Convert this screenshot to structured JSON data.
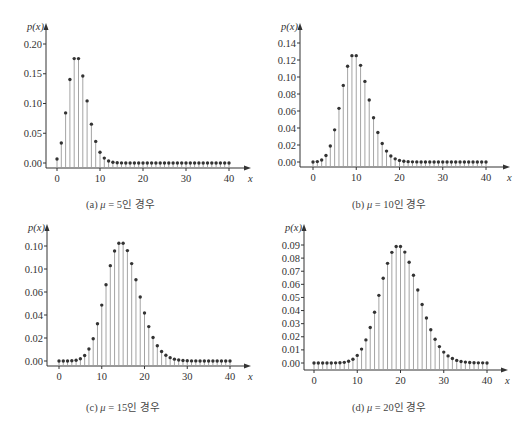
{
  "figure": {
    "caption_cropped": "",
    "colors": {
      "stem": "#9a9a9a",
      "dot": "#333333",
      "axis": "#333333",
      "text": "#333333"
    }
  },
  "chart_data": [
    {
      "id": "a",
      "type": "stem",
      "title": "",
      "caption": {
        "prefix": "(a) ",
        "mu_symbol": "μ",
        "rest": " = 5인 경우"
      },
      "xlabel": "x",
      "ylabel": "p(x)",
      "x_ticks": [
        "0",
        "10",
        "20",
        "30",
        "40"
      ],
      "y_ticks": [
        "0.00",
        "0.05",
        "0.10",
        "0.15",
        "0.20"
      ],
      "y_tick_values": [
        0.0,
        0.05,
        0.1,
        0.15,
        0.2
      ],
      "xlim": [
        0,
        40
      ],
      "ylim": [
        0,
        0.2
      ],
      "grid": false,
      "layout": {
        "x0": 57,
        "x40": 229,
        "y0px": 163,
        "ytop_px": 44,
        "ytop_val": 0.2,
        "yaxis_x": 46,
        "xaxis_y": 168,
        "arrow_right": 251,
        "arrow_top": 23,
        "tick_label_y": 182,
        "cap_x": 86,
        "cap_y": 196
      },
      "x": [
        0,
        1,
        2,
        3,
        4,
        5,
        6,
        7,
        8,
        9,
        10,
        11,
        12,
        13,
        14,
        15,
        16,
        17,
        18,
        19,
        20,
        21,
        22,
        23,
        24,
        25,
        26,
        27,
        28,
        29,
        30,
        31,
        32,
        33,
        34,
        35,
        36,
        37,
        38,
        39,
        40
      ],
      "values": [
        0.0067,
        0.0337,
        0.0842,
        0.1404,
        0.1755,
        0.1755,
        0.1462,
        0.1044,
        0.0653,
        0.0363,
        0.0181,
        0.0082,
        0.0034,
        0.0013,
        0.0005,
        0.0002,
        0.0,
        0.0,
        0.0,
        0.0,
        0.0,
        0.0,
        0.0,
        0.0,
        0.0,
        0.0,
        0.0,
        0.0,
        0.0,
        0.0,
        0.0,
        0.0,
        0.0,
        0.0,
        0.0,
        0.0,
        0.0,
        0.0,
        0.0,
        0.0,
        0.0
      ]
    },
    {
      "id": "b",
      "type": "stem",
      "title": "",
      "caption": {
        "prefix": "(b) ",
        "mu_symbol": "μ",
        "rest": " = 10인 경우"
      },
      "xlabel": "x",
      "ylabel": "p(x)",
      "x_ticks": [
        "0",
        "10",
        "20",
        "30",
        "40"
      ],
      "y_ticks": [
        "0.00",
        "0.02",
        "0.04",
        "0.06",
        "0.08",
        "0.10",
        "0.12",
        "0.14"
      ],
      "y_tick_values": [
        0.0,
        0.02,
        0.04,
        0.06,
        0.08,
        0.1,
        0.12,
        0.14
      ],
      "xlim": [
        0,
        40
      ],
      "ylim": [
        0,
        0.14
      ],
      "grid": false,
      "layout": {
        "x0": 313,
        "x40": 486,
        "y0px": 162,
        "ytop_px": 43,
        "ytop_val": 0.14,
        "yaxis_x": 300,
        "xaxis_y": 167,
        "arrow_right": 510,
        "arrow_top": 23,
        "tick_label_y": 181,
        "cap_x": 352,
        "cap_y": 196
      },
      "x": [
        0,
        1,
        2,
        3,
        4,
        5,
        6,
        7,
        8,
        9,
        10,
        11,
        12,
        13,
        14,
        15,
        16,
        17,
        18,
        19,
        20,
        21,
        22,
        23,
        24,
        25,
        26,
        27,
        28,
        29,
        30,
        31,
        32,
        33,
        34,
        35,
        36,
        37,
        38,
        39,
        40
      ],
      "values": [
        0.0,
        0.0005,
        0.0023,
        0.0076,
        0.0189,
        0.0378,
        0.0631,
        0.0901,
        0.1126,
        0.1251,
        0.1251,
        0.1137,
        0.0948,
        0.0729,
        0.0521,
        0.0347,
        0.0217,
        0.0128,
        0.0071,
        0.0037,
        0.0019,
        0.0009,
        0.0004,
        0.0002,
        0.0001,
        0.0,
        0.0,
        0.0,
        0.0,
        0.0,
        0.0,
        0.0,
        0.0,
        0.0,
        0.0,
        0.0,
        0.0,
        0.0,
        0.0,
        0.0,
        0.0
      ]
    },
    {
      "id": "c",
      "type": "stem",
      "title": "",
      "caption": {
        "prefix": "(c) ",
        "mu_symbol": "μ",
        "rest": " = 15인 경우"
      },
      "xlabel": "x",
      "ylabel": "p(x)",
      "x_ticks": [
        "0",
        "10",
        "20",
        "30",
        "40"
      ],
      "y_ticks": [
        "0.00",
        "0.02",
        "0.04",
        "0.06",
        "0.10",
        "0.10"
      ],
      "y_tick_values": [
        0.0,
        0.02,
        0.04,
        0.06,
        0.08,
        0.1
      ],
      "xlim": [
        0,
        40
      ],
      "ylim": [
        0,
        0.1
      ],
      "grid": false,
      "layout": {
        "x0": 59,
        "x40": 230,
        "y0px": 361,
        "ytop_px": 246,
        "ytop_val": 0.1,
        "yaxis_x": 47,
        "xaxis_y": 366,
        "arrow_right": 251,
        "arrow_top": 224,
        "tick_label_y": 380,
        "cap_x": 86,
        "cap_y": 399
      },
      "x": [
        0,
        1,
        2,
        3,
        4,
        5,
        6,
        7,
        8,
        9,
        10,
        11,
        12,
        13,
        14,
        15,
        16,
        17,
        18,
        19,
        20,
        21,
        22,
        23,
        24,
        25,
        26,
        27,
        28,
        29,
        30,
        31,
        32,
        33,
        34,
        35,
        36,
        37,
        38,
        39,
        40
      ],
      "values": [
        0.0,
        0.0,
        0.0,
        0.0002,
        0.0006,
        0.0019,
        0.0048,
        0.0104,
        0.0194,
        0.0324,
        0.0486,
        0.0663,
        0.0829,
        0.0956,
        0.1024,
        0.1024,
        0.096,
        0.0847,
        0.0706,
        0.0557,
        0.0418,
        0.0299,
        0.0204,
        0.0133,
        0.0083,
        0.005,
        0.0029,
        0.0016,
        0.0009,
        0.0004,
        0.0002,
        0.0001,
        0.0001,
        0.0,
        0.0,
        0.0,
        0.0,
        0.0,
        0.0,
        0.0,
        0.0
      ]
    },
    {
      "id": "d",
      "type": "stem",
      "title": "",
      "caption": {
        "prefix": "(d) ",
        "mu_symbol": "μ",
        "rest": " = 20인 경우"
      },
      "xlabel": "x",
      "ylabel": "p(x)",
      "x_ticks": [
        "0",
        "10",
        "20",
        "30",
        "40"
      ],
      "y_ticks": [
        "0.00",
        "0.01",
        "0.02",
        "0.03",
        "0.04",
        "0.05",
        "0.06",
        "0.07",
        "0.08",
        "0.09"
      ],
      "y_tick_values": [
        0.0,
        0.01,
        0.02,
        0.03,
        0.04,
        0.05,
        0.06,
        0.07,
        0.08,
        0.09
      ],
      "xlim": [
        0,
        40
      ],
      "ylim": [
        0,
        0.09
      ],
      "grid": false,
      "layout": {
        "x0": 314,
        "x40": 487,
        "y0px": 363,
        "ytop_px": 245,
        "ytop_val": 0.09,
        "yaxis_x": 304,
        "xaxis_y": 370,
        "arrow_right": 508,
        "arrow_top": 224,
        "tick_label_y": 384,
        "cap_x": 352,
        "cap_y": 399
      },
      "x": [
        0,
        1,
        2,
        3,
        4,
        5,
        6,
        7,
        8,
        9,
        10,
        11,
        12,
        13,
        14,
        15,
        16,
        17,
        18,
        19,
        20,
        21,
        22,
        23,
        24,
        25,
        26,
        27,
        28,
        29,
        30,
        31,
        32,
        33,
        34,
        35,
        36,
        37,
        38,
        39,
        40
      ],
      "values": [
        0.0,
        0.0,
        0.0,
        0.0,
        0.0,
        0.0001,
        0.0002,
        0.0005,
        0.0013,
        0.0029,
        0.0058,
        0.0106,
        0.0176,
        0.0271,
        0.0387,
        0.0516,
        0.0646,
        0.076,
        0.0844,
        0.0888,
        0.0888,
        0.0846,
        0.0769,
        0.0669,
        0.0557,
        0.0446,
        0.0343,
        0.0254,
        0.0181,
        0.0125,
        0.0083,
        0.0054,
        0.0034,
        0.002,
        0.0012,
        0.0007,
        0.0004,
        0.0002,
        0.0001,
        0.0001,
        0.0
      ]
    }
  ]
}
